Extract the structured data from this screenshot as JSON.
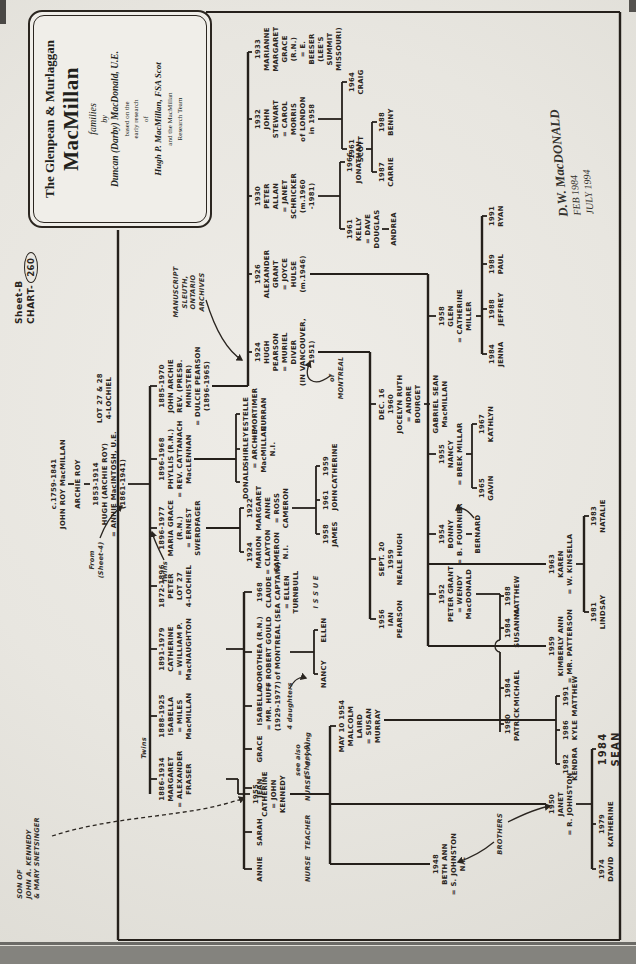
{
  "page": {
    "sheet": "Sheet-B",
    "chart_prefix": "CHART-",
    "chart_number": "260"
  },
  "title_box": {
    "line1": "The Glenpean & Murlaggan",
    "name": "MacMillan",
    "families": "families",
    "by": "by",
    "author": "Duncan (Darby) MacDonald, U.E.",
    "based1": "based on the",
    "based2": "early research",
    "based3": "of",
    "researcher": "Hugh P. MacMillan, FSA Scot",
    "team1": "and the MacMillan",
    "team2": "Research Team"
  },
  "signature": {
    "line1": "D.W. MacDONALD",
    "line2": "FEB 1984",
    "line3": "JULY 1994"
  },
  "ancestors": {
    "origin": [
      "c.1759-1841",
      "JOHN ROY MacMILLAN"
    ],
    "archie": [
      "ARCHIE ROY"
    ],
    "hugh": [
      "1853-1914",
      "HUGH (ARCHIE ROY)",
      "= ANNIE MacINTOSH, U.E.",
      "(1861-1941)"
    ],
    "lot": [
      "LOT 27 & 28",
      "4-LOCHIEL"
    ]
  },
  "annotations": {
    "from_sheet": [
      "From",
      "(Sheet-4)"
    ],
    "kennedy_note": [
      "SON OF",
      "JOHN A. KENNEDY",
      "& MARY SNETSINGER"
    ],
    "manuscript_note": [
      "MANUSCRIPT",
      "SLEUTH,",
      "ONTARIO",
      "ARCHIVES"
    ],
    "of_montreal": [
      "of",
      "MONTREAL"
    ],
    "twins_left": "Twins",
    "twins_right": "Twins",
    "brothers": "BROTHERS",
    "issue": "I S S U E",
    "four_daughters": "4 daughters",
    "see_sheet": [
      "see also",
      "(Sheet-9)"
    ],
    "professions": {
      "annie": "NURSE",
      "sarah": "TEACHER",
      "jean": "NURSE",
      "grace": "d. young"
    }
  },
  "people": [
    {
      "id": "margaret",
      "lines": [
        "1886-1934",
        "MARGARET",
        "= ALEXANDER",
        "FRASER"
      ]
    },
    {
      "id": "isabella",
      "lines": [
        "1888-1925",
        "ISABELLA",
        "= MILES",
        "MacMILLAN"
      ]
    },
    {
      "id": "catherine_macnaughton",
      "lines": [
        "1891-1979",
        "CATHERINE",
        "= WILLIAM P.",
        "MacNAUGHTON"
      ]
    },
    {
      "id": "peter",
      "lines": [
        "1872-1896",
        "PETER",
        "LOT 27",
        "4-LOCHIEL"
      ]
    },
    {
      "id": "maria_grace",
      "lines": [
        "1896-1977",
        "MARIA GRACE",
        "(R.N.)",
        "= ERNEST",
        "SWERDFAGER"
      ]
    },
    {
      "id": "phyllis",
      "lines": [
        "1896-1968",
        "PHYLLIS (R.N.)",
        "= REV. CATTANACH",
        "MacLENNAN"
      ]
    },
    {
      "id": "john_archie",
      "lines": [
        "1885-1970",
        "JOHN ARCHIE",
        "REV. (PRESB.",
        "MINISTER)",
        "= DULCIE PEARSON",
        "(1896-1965)"
      ]
    },
    {
      "id": "catherine_kennedy",
      "lines": [
        "1955",
        "CATHERINE",
        "= JOHN",
        "KENNEDY"
      ]
    },
    {
      "id": "beth_ann",
      "lines": [
        "1948",
        "BETH ANN",
        "= S. JOHNSTON",
        "N.I."
      ]
    },
    {
      "id": "janet_k",
      "lines": [
        "1950",
        "JANET",
        "= R. JOHNSTON"
      ]
    },
    {
      "id": "malcolm",
      "lines": [
        "MAY 10 1954",
        "MALCOLM",
        "LAIRD",
        "= SUSAN",
        "MURRAY"
      ]
    },
    {
      "id": "david",
      "lines": [
        "1974",
        "DAVID"
      ]
    },
    {
      "id": "katherine_j",
      "lines": [
        "1979",
        "KATHERINE"
      ]
    },
    {
      "id": "sean",
      "lines": [
        "1984",
        "SEAN"
      ]
    },
    {
      "id": "kendra",
      "lines": [
        "1982",
        "KENDRA"
      ]
    },
    {
      "id": "kyle",
      "lines": [
        "1986",
        "KYLE"
      ]
    },
    {
      "id": "matthew_91",
      "lines": [
        "1991",
        "MATTHEW"
      ]
    },
    {
      "id": "annie",
      "lines": [
        "ANNIE"
      ]
    },
    {
      "id": "sarah",
      "lines": [
        "SARAH"
      ]
    },
    {
      "id": "jean",
      "lines": [
        "JEAN"
      ]
    },
    {
      "id": "grace",
      "lines": [
        "GRACE"
      ]
    },
    {
      "id": "isabella_huff",
      "lines": [
        "ISABELLA",
        "= MR. HUFF",
        "(1929-1977)"
      ]
    },
    {
      "id": "dorothea",
      "lines": [
        "DOROTHEA (R.N.)",
        "= ROBERT GOULD",
        "of MONTREAL"
      ]
    },
    {
      "id": "claude",
      "lines": [
        "1968",
        "CLAUDE",
        "(SEA CAPTAIN)",
        "= ELLEN",
        "TURNBULL"
      ]
    },
    {
      "id": "nancy_gould",
      "lines": [
        "NANCY"
      ]
    },
    {
      "id": "ellen_gould",
      "lines": [
        "ELLEN"
      ]
    },
    {
      "id": "marion",
      "lines": [
        "1924",
        "MARION",
        "= CLAYTON",
        "CAMERON",
        "N.I."
      ]
    },
    {
      "id": "margaret_anne",
      "lines": [
        "1922",
        "MARGARET",
        "ANNE",
        "= ROSS",
        "CAMERON"
      ]
    },
    {
      "id": "james",
      "lines": [
        "1958",
        "JAMES"
      ]
    },
    {
      "id": "john_cameron",
      "lines": [
        "1961",
        "JOHN"
      ]
    },
    {
      "id": "catherine_cameron",
      "lines": [
        "1959",
        "CATHERINE"
      ]
    },
    {
      "id": "donald",
      "lines": [
        "DONALD"
      ]
    },
    {
      "id": "shirley",
      "lines": [
        "SHIRLEY",
        "= ARCHIE",
        "MacMILLAN",
        "N.I."
      ]
    },
    {
      "id": "estelle",
      "lines": [
        "ESTELLE",
        "= MORTIMER",
        "CURRAN"
      ]
    },
    {
      "id": "hugh_pearson",
      "lines": [
        "1924",
        "HUGH",
        "PEARSON",
        "= MURIEL",
        "DIVER",
        "(IN VANCOUVER,",
        "1951)"
      ]
    },
    {
      "id": "alexander_grant",
      "lines": [
        "1926",
        "ALEXANDER",
        "GRANT",
        "= JOYCE",
        "HULSE",
        "(m.1946)"
      ]
    },
    {
      "id": "peter_allan",
      "lines": [
        "1930",
        "PETER",
        "ALLAN",
        "= JANET",
        "SCHRICKER",
        "(m.1960",
        "-1981)"
      ]
    },
    {
      "id": "john_stewart",
      "lines": [
        "1932",
        "JOHN",
        "STEWART",
        "= CAROL",
        "MORRIS",
        "of LONDON",
        "in 1958"
      ]
    },
    {
      "id": "marianne",
      "lines": [
        "1933",
        "MARIANNE",
        "MARGARET",
        "GRACE (R.N.)",
        "= E. BEESER",
        "(LEE'S SUMMIT",
        "MISSOURI)"
      ]
    },
    {
      "id": "ian",
      "lines": [
        "1956",
        "IAN",
        "PEARSON"
      ]
    },
    {
      "id": "neale",
      "lines": [
        "SEPT. 20",
        "1959",
        "NEALE HUGH"
      ]
    },
    {
      "id": "jocelyn",
      "lines": [
        "DEC. 16",
        "1960",
        "JOCELYN RUTH",
        "= ANDRE",
        "BOURGET"
      ]
    },
    {
      "id": "gabriel",
      "lines": [
        "GABRIEL SEAN",
        "MacMILLAN"
      ]
    },
    {
      "id": "peter_grant",
      "lines": [
        "1952",
        "PETER GRANT",
        "= WENDY",
        "MacDONALD"
      ]
    },
    {
      "id": "bonny",
      "lines": [
        "1954",
        "BONNY",
        "= B. FOURNIER"
      ]
    },
    {
      "id": "nancy_millar",
      "lines": [
        "1955",
        "NANCY",
        "= BREK MILLAR"
      ]
    },
    {
      "id": "glen",
      "lines": [
        "1958",
        "GLEN",
        "= CATHERINE",
        "MILLER"
      ]
    },
    {
      "id": "kimberly",
      "lines": [
        "1959",
        "KIMBERLY ANN",
        "= MR. PATTERSON"
      ]
    },
    {
      "id": "karen",
      "lines": [
        "1963",
        "KAREN",
        "= W. KINSELLA"
      ]
    },
    {
      "id": "patrick",
      "lines": [
        "1980",
        "PATRICK"
      ]
    },
    {
      "id": "michael",
      "lines": [
        "1984",
        "MICHAEL"
      ]
    },
    {
      "id": "susanna",
      "lines": [
        "1984",
        "SUSANNA"
      ]
    },
    {
      "id": "matthew_88",
      "lines": [
        "1988",
        "MATTHEW"
      ]
    },
    {
      "id": "bernard",
      "lines": [
        "BERNARD"
      ]
    },
    {
      "id": "gavin",
      "lines": [
        "1965",
        "GAVIN"
      ]
    },
    {
      "id": "kathlyn",
      "lines": [
        "1967",
        "KATHLYN"
      ]
    },
    {
      "id": "jenna",
      "lines": [
        "1984",
        "JENNA"
      ]
    },
    {
      "id": "jeffrey",
      "lines": [
        "1988",
        "JEFFREY"
      ]
    },
    {
      "id": "paul",
      "lines": [
        "1989",
        "PAUL"
      ]
    },
    {
      "id": "ryan",
      "lines": [
        "1991",
        "RYAN"
      ]
    },
    {
      "id": "lindsay",
      "lines": [
        "1981",
        "LINDSAY"
      ]
    },
    {
      "id": "natalie",
      "lines": [
        "1983",
        "NATALIE"
      ]
    },
    {
      "id": "kelly",
      "lines": [
        "1961",
        "KELLY",
        "= DAVE",
        "DOUGLAS"
      ]
    },
    {
      "id": "jonathan",
      "lines": [
        "1966",
        "JONATHAN"
      ]
    },
    {
      "id": "andrea",
      "lines": [
        "ANDREA"
      ]
    },
    {
      "id": "scott",
      "lines": [
        "1961",
        "SCOTT"
      ]
    },
    {
      "id": "craig",
      "lines": [
        "1964",
        "CRAIG"
      ]
    },
    {
      "id": "carrie",
      "lines": [
        "1987",
        "CARRIE"
      ]
    },
    {
      "id": "benny",
      "lines": [
        "1988",
        "BENNY"
      ]
    }
  ]
}
